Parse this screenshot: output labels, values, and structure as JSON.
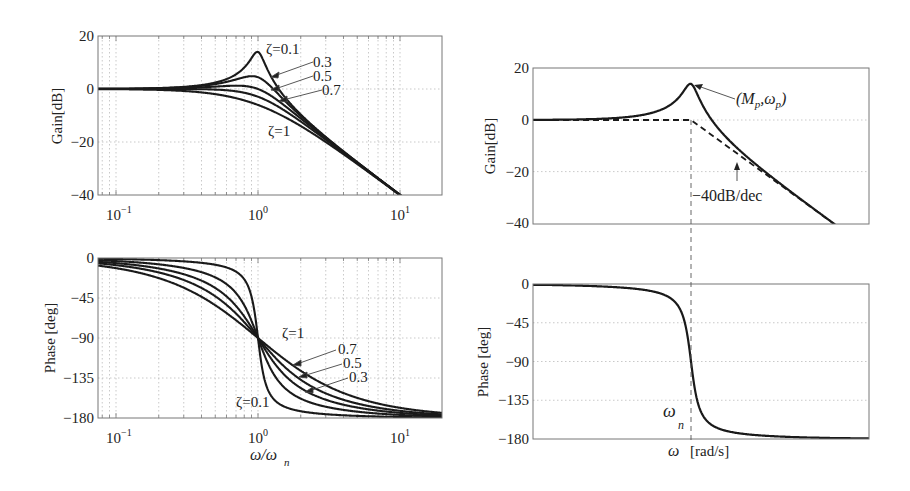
{
  "figure": {
    "left": {
      "gain_plot": {
        "ylabel": "Gain[dB]",
        "yticks": [
          20,
          0,
          -20,
          -40
        ],
        "xticks": [
          "10",
          "10",
          "10"
        ],
        "xtick_exponents": [
          "-1",
          "0",
          "1"
        ],
        "curve_labels": [
          {
            "text": "ζ=0.1",
            "zeta": 0.1
          },
          {
            "text": "0.3",
            "zeta": 0.3
          },
          {
            "text": "0.5",
            "zeta": 0.5
          },
          {
            "text": "0.7",
            "zeta": 0.7
          },
          {
            "text": "ζ=1",
            "zeta": 1
          }
        ]
      },
      "phase_plot": {
        "ylabel": "Phase [deg]",
        "yticks": [
          0,
          -45,
          -90,
          -135,
          -180
        ],
        "xticks": [
          "10",
          "10",
          "10"
        ],
        "xtick_exponents": [
          "-1",
          "0",
          "1"
        ],
        "xlabel_main": "ω/ω",
        "xlabel_sub": "n",
        "curve_labels": [
          {
            "text": "ζ=1",
            "zeta": 1
          },
          {
            "text": "0.7",
            "zeta": 0.7
          },
          {
            "text": "0.5",
            "zeta": 0.5
          },
          {
            "text": "0.3",
            "zeta": 0.3
          },
          {
            "text": "ζ=0.1",
            "zeta": 0.1
          }
        ]
      }
    },
    "right": {
      "gain_plot": {
        "ylabel": "Gain[dB]",
        "yticks": [
          20,
          0,
          -20,
          -40
        ],
        "peak_label": "(M",
        "peak_label_sub1": "p",
        "peak_label_mid": ",ω",
        "peak_label_sub2": "p",
        "peak_label_end": ")",
        "slope_label": "−40dB/dec"
      },
      "phase_plot": {
        "ylabel": "Phase [deg]",
        "yticks": [
          0,
          -45,
          -90,
          -135,
          -180
        ],
        "wn_label": "ω",
        "wn_sub": "n",
        "xlabel_omega": "ω",
        "xlabel_unit": "[rad/s]"
      }
    }
  },
  "chart_data": [
    {
      "type": "line",
      "title": "",
      "xlabel": "ω/ωn",
      "ylabel": "Gain[dB]",
      "xscale": "log",
      "xlim": [
        0.076,
        20
      ],
      "ylim": [
        -40,
        20
      ],
      "grid": true,
      "series": [
        {
          "name": "ζ=0.1",
          "zeta": 0.1,
          "peak_db": 14.0
        },
        {
          "name": "ζ=0.3",
          "zeta": 0.3,
          "peak_db": 4.8
        },
        {
          "name": "ζ=0.5",
          "zeta": 0.5,
          "peak_db": 1.2
        },
        {
          "name": "ζ=0.7",
          "zeta": 0.7,
          "peak_db": 0.0
        },
        {
          "name": "ζ=1",
          "zeta": 1.0,
          "peak_db": 0.0
        }
      ],
      "note": "Second-order system gain: -20log10(sqrt((1-u^2)^2+(2ζu)^2)), u=ω/ωn; reaches -40 dB at u=10"
    },
    {
      "type": "line",
      "xlabel": "ω/ωn",
      "ylabel": "Phase [deg]",
      "xscale": "log",
      "xlim": [
        0.076,
        20
      ],
      "ylim": [
        -180,
        0
      ],
      "yticks": [
        0,
        -45,
        -90,
        -135,
        -180
      ],
      "grid": true,
      "series": [
        {
          "name": "ζ=0.1",
          "zeta": 0.1
        },
        {
          "name": "ζ=0.3",
          "zeta": 0.3
        },
        {
          "name": "ζ=0.5",
          "zeta": 0.5
        },
        {
          "name": "ζ=0.7",
          "zeta": 0.7
        },
        {
          "name": "ζ=1",
          "zeta": 1.0
        }
      ],
      "note": "All curves pass through -90° at ω/ωn = 1"
    },
    {
      "type": "line",
      "xlabel": "ω [rad/s]",
      "ylabel": "Gain[dB]",
      "ylim": [
        -40,
        20
      ],
      "yticks": [
        20,
        0,
        -20,
        -40
      ],
      "series": [
        {
          "name": "gain (ζ≈0.1)",
          "zeta": 0.1,
          "style": "solid"
        },
        {
          "name": "asymptote",
          "style": "dashed",
          "points": "0 dB flat until ωn, then -40dB/dec"
        }
      ],
      "annotations": [
        "(Mp,ωp)",
        "−40dB/dec",
        "ωn"
      ]
    },
    {
      "type": "line",
      "xlabel": "ω [rad/s]",
      "ylabel": "Phase [deg]",
      "ylim": [
        -180,
        0
      ],
      "yticks": [
        0,
        -45,
        -90,
        -135,
        -180
      ],
      "series": [
        {
          "name": "phase (ζ≈0.1)",
          "zeta": 0.1
        }
      ],
      "annotations": [
        "ωn"
      ]
    }
  ]
}
